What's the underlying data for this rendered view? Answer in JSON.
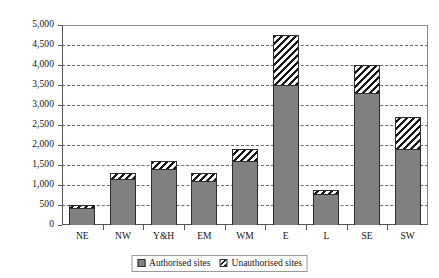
{
  "chart_data": {
    "type": "bar",
    "stacked": true,
    "title": "",
    "xlabel": "",
    "ylabel": "",
    "ylim": [
      0,
      5000
    ],
    "grid": true,
    "legend_position": "bottom",
    "categories": [
      "NE",
      "NW",
      "Y&H",
      "EM",
      "WM",
      "E",
      "L",
      "SE",
      "SW"
    ],
    "ytick_labels": [
      "5,000",
      "4,500",
      "4,000",
      "3,500",
      "3,000",
      "2,500",
      "2,000",
      "1,500",
      "1,000",
      "500",
      "0"
    ],
    "ytick_values": [
      5000,
      4500,
      4000,
      3500,
      3000,
      2500,
      2000,
      1500,
      1000,
      500,
      0
    ],
    "series": [
      {
        "name": "Authorised sites",
        "color": "#808080",
        "fill": "solid",
        "values": [
          420,
          1150,
          1400,
          1100,
          1600,
          3500,
          780,
          3300,
          1900
        ]
      },
      {
        "name": "Unauthorised sites",
        "color": "#151515",
        "fill": "diagonal-hatch",
        "values": [
          80,
          150,
          200,
          200,
          300,
          1250,
          100,
          700,
          800
        ]
      }
    ],
    "totals": [
      500,
      1300,
      1600,
      1300,
      1900,
      4750,
      880,
      4000,
      2700
    ]
  },
  "legend": {
    "items": [
      {
        "label": "Authorised sites",
        "swatch": "solid-grey-swatch"
      },
      {
        "label": "Unauthorised sites",
        "swatch": "hatched-swatch"
      }
    ]
  }
}
